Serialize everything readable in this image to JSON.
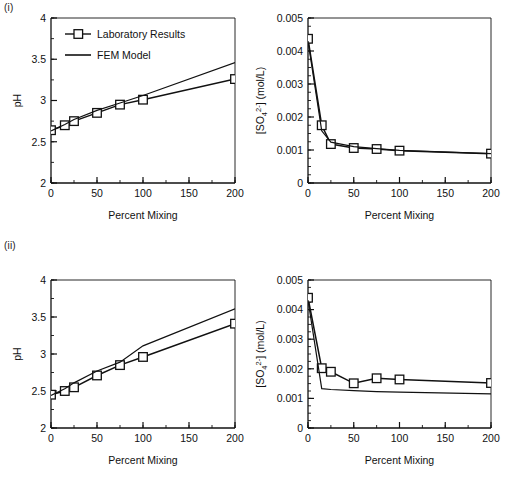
{
  "figure": {
    "panel_labels": [
      {
        "id": "panel-i-label",
        "text": "(i)"
      },
      {
        "id": "panel-ii-label",
        "text": "(ii)"
      }
    ]
  },
  "legend": {
    "entries": [
      {
        "label": "Laboratory Results",
        "marker": "open-square-with-line"
      },
      {
        "label": "FEM Model",
        "marker": "line"
      }
    ]
  },
  "chart_data": [
    {
      "id": "chart-i-ph",
      "type": "line",
      "title": "",
      "xlabel": "Percent Mixing",
      "ylabel": "pH",
      "xlim": [
        0,
        200
      ],
      "ylim": [
        2,
        4
      ],
      "xticks": [
        0,
        50,
        100,
        150,
        200
      ],
      "xticklabels": [
        "0",
        "50",
        "100",
        "150",
        "200"
      ],
      "xminor_step": 25,
      "yticks": [
        2,
        2.5,
        3,
        3.5,
        4
      ],
      "yticklabels": [
        "2",
        "2.5",
        "3",
        "3.5",
        "4"
      ],
      "yminor_step": 0.25,
      "grid": false,
      "legend_position": "upper-left-inside",
      "series": [
        {
          "name": "Laboratory Results",
          "marker": "open-square",
          "x": [
            0,
            15,
            25,
            50,
            75,
            100,
            200
          ],
          "values": [
            2.64,
            2.7,
            2.75,
            2.85,
            2.95,
            3.01,
            3.26
          ]
        },
        {
          "name": "FEM Model",
          "marker": "none",
          "x": [
            0,
            15,
            25,
            50,
            75,
            100,
            200
          ],
          "values": [
            2.63,
            2.71,
            2.77,
            2.88,
            2.97,
            3.06,
            3.46
          ]
        }
      ]
    },
    {
      "id": "chart-i-so4",
      "type": "line",
      "title": "",
      "xlabel": "Percent Mixing",
      "ylabel": "[SO4 2-] (mol/L)",
      "ylabel_parts": {
        "prefix": "[SO",
        "sub": "4",
        "sup": "2-",
        "suffix": "] (mol/L)"
      },
      "xlim": [
        0,
        200
      ],
      "ylim": [
        0,
        0.005
      ],
      "xticks": [
        0,
        50,
        100,
        150,
        200
      ],
      "xticklabels": [
        "0",
        "50",
        "100",
        "150",
        "200"
      ],
      "xminor_step": 25,
      "yticks": [
        0,
        0.001,
        0.002,
        0.003,
        0.004,
        0.005
      ],
      "yticklabels": [
        "0",
        "0.001",
        "0.002",
        "0.003",
        "0.004",
        "0.005"
      ],
      "yminor_step": 0.00025,
      "grid": false,
      "legend_position": "none",
      "series": [
        {
          "name": "Laboratory Results",
          "marker": "open-square",
          "x": [
            0,
            15,
            25,
            50,
            75,
            100,
            200
          ],
          "values": [
            0.00437,
            0.00175,
            0.00118,
            0.00106,
            0.00103,
            0.00098,
            0.00089
          ]
        },
        {
          "name": "FEM Model",
          "marker": "none",
          "x": [
            0,
            15,
            25,
            50,
            75,
            100,
            200
          ],
          "values": [
            0.0043,
            0.00158,
            0.00124,
            0.0011,
            0.00104,
            0.00099,
            0.00089
          ]
        }
      ]
    },
    {
      "id": "chart-ii-ph",
      "type": "line",
      "title": "",
      "xlabel": "Percent Mixing",
      "ylabel": "pH",
      "xlim": [
        0,
        200
      ],
      "ylim": [
        2,
        4
      ],
      "xticks": [
        0,
        50,
        100,
        150,
        200
      ],
      "xticklabels": [
        "0",
        "50",
        "100",
        "150",
        "200"
      ],
      "xminor_step": 25,
      "yticks": [
        2,
        2.5,
        3,
        3.5,
        4
      ],
      "yticklabels": [
        "2",
        "2.5",
        "3",
        "3.5",
        "4"
      ],
      "yminor_step": 0.25,
      "grid": false,
      "legend_position": "none",
      "series": [
        {
          "name": "Laboratory Results",
          "marker": "open-square",
          "x": [
            0,
            15,
            25,
            50,
            75,
            100,
            200
          ],
          "values": [
            2.45,
            2.5,
            2.55,
            2.71,
            2.85,
            2.96,
            3.41
          ]
        },
        {
          "name": "FEM Model",
          "marker": "none",
          "x": [
            0,
            15,
            25,
            50,
            75,
            100,
            200
          ],
          "values": [
            2.44,
            2.53,
            2.61,
            2.77,
            2.89,
            3.11,
            3.61
          ]
        }
      ]
    },
    {
      "id": "chart-ii-so4",
      "type": "line",
      "title": "",
      "xlabel": "Percent Mixing",
      "ylabel": "[SO4 2-] (mol/L)",
      "ylabel_parts": {
        "prefix": "[SO",
        "sub": "4",
        "sup": "2-",
        "suffix": "] (mol/L)"
      },
      "xlim": [
        0,
        200
      ],
      "ylim": [
        0,
        0.005
      ],
      "xticks": [
        0,
        50,
        100,
        150,
        200
      ],
      "xticklabels": [
        "0",
        "50",
        "100",
        "150",
        "200"
      ],
      "xminor_step": 25,
      "yticks": [
        0,
        0.001,
        0.002,
        0.003,
        0.004,
        0.005
      ],
      "yticklabels": [
        "0",
        "0.001",
        "0.002",
        "0.003",
        "0.004",
        "0.005"
      ],
      "yminor_step": 0.00025,
      "grid": false,
      "legend_position": "none",
      "series": [
        {
          "name": "Laboratory Results",
          "marker": "open-square",
          "x": [
            0,
            15,
            25,
            50,
            75,
            100,
            200
          ],
          "values": [
            0.0044,
            0.00202,
            0.0019,
            0.00151,
            0.00168,
            0.00164,
            0.00152
          ]
        },
        {
          "name": "FEM Model",
          "marker": "none",
          "x": [
            0,
            15,
            25,
            50,
            75,
            100,
            200
          ],
          "values": [
            0.00432,
            0.00133,
            0.0013,
            0.00126,
            0.00123,
            0.00121,
            0.00115
          ]
        }
      ]
    }
  ],
  "colors": {
    "ink": "#111111",
    "background": "#ffffff"
  }
}
